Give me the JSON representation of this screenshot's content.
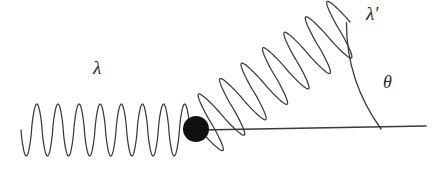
{
  "figure": {
    "kind": "compton-scattering-diagram",
    "background_color": "#ffffff",
    "stroke_color": "#3a3a3a",
    "electron_color": "#111111",
    "width": 435,
    "height": 169
  },
  "labels": {
    "incident_wavelength": "λ",
    "scattered_wavelength": "λ′",
    "scattering_angle": "θ"
  },
  "geometry": {
    "axis": {
      "name": "horizontal-axis",
      "x1": 200,
      "y1": 130,
      "x2": 426,
      "y2": 126
    },
    "electron": {
      "name": "electron-sphere",
      "cx": 196,
      "cy": 129,
      "r": 13
    },
    "incident_wave": {
      "name": "incident-photon-wave",
      "start_x": 21,
      "end_x": 190,
      "center_y": 130,
      "amplitude": 26,
      "cycles": 8,
      "direction_deg": 0
    },
    "scattered_wave": {
      "name": "scattered-photon-wave",
      "start_x": 200,
      "start_y": 130,
      "end_x": 350,
      "end_y": 22,
      "amplitude": 30,
      "cycles": 7,
      "direction_deg": 36
    },
    "angle_arc": {
      "name": "theta-arc",
      "vertex_x": 200,
      "vertex_y": 129,
      "radius": 181,
      "start_deg": 0,
      "end_deg": 36
    }
  }
}
